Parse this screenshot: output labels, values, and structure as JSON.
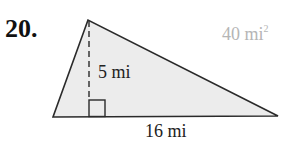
{
  "problem": {
    "number": "20.",
    "answer_value": "40 mi",
    "answer_exponent": "2"
  },
  "figure": {
    "shape": "triangle",
    "height_label": "5 mi",
    "base_label": "16 mi",
    "fill_color": "#ececec",
    "stroke_color": "#2a2a2a",
    "right_angle_marker": true
  }
}
